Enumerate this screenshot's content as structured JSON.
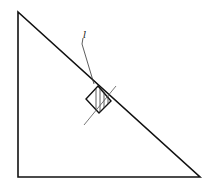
{
  "diagram": {
    "type": "physics-incline",
    "label_l": "l",
    "colors": {
      "stroke": "#111111",
      "background": "#ffffff",
      "hatch": "#333333"
    },
    "triangle": {
      "points": [
        [
          18,
          12
        ],
        [
          18,
          177
        ],
        [
          200,
          177
        ]
      ]
    },
    "block": {
      "points": [
        [
          98,
          86
        ],
        [
          111,
          101
        ],
        [
          99,
          113
        ],
        [
          86,
          99
        ]
      ]
    },
    "guide_line": {
      "from": [
        84,
        125
      ],
      "to": [
        116,
        86
      ]
    },
    "leader_line": {
      "from": [
        82,
        40
      ],
      "to": [
        94,
        84
      ]
    }
  }
}
